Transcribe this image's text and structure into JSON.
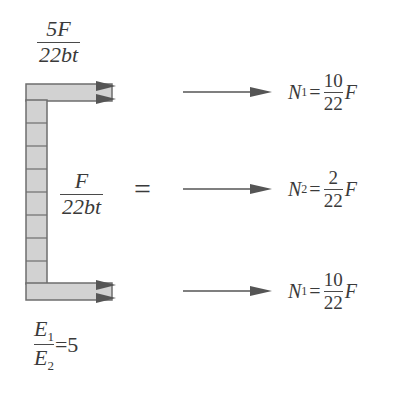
{
  "diagram": {
    "top_flange_stress": {
      "numerator": "5F",
      "denominator": "22bt"
    },
    "web_stress": {
      "numerator": "F",
      "denominator": "22bt"
    },
    "equals_sign": "=",
    "modulus_ratio": {
      "numerator": "E",
      "numerator_sub": "1",
      "denominator": "E",
      "denominator_sub": "2",
      "value": "=5"
    },
    "web_cells": 8,
    "forces": [
      {
        "label": "N",
        "sub": "1",
        "eq": "=",
        "numerator": "10",
        "denominator": "22",
        "var": "F"
      },
      {
        "label": "N",
        "sub": "2",
        "eq": "=",
        "numerator": "2",
        "denominator": "22",
        "var": "F"
      },
      {
        "label": "N",
        "sub": "1",
        "eq": "=",
        "numerator": "10",
        "denominator": "22",
        "var": "F"
      }
    ],
    "colors": {
      "fill": "#d2d2d2",
      "stroke": "#6e6e6e",
      "arrow": "#555555",
      "text": "#3a3a3a"
    }
  }
}
